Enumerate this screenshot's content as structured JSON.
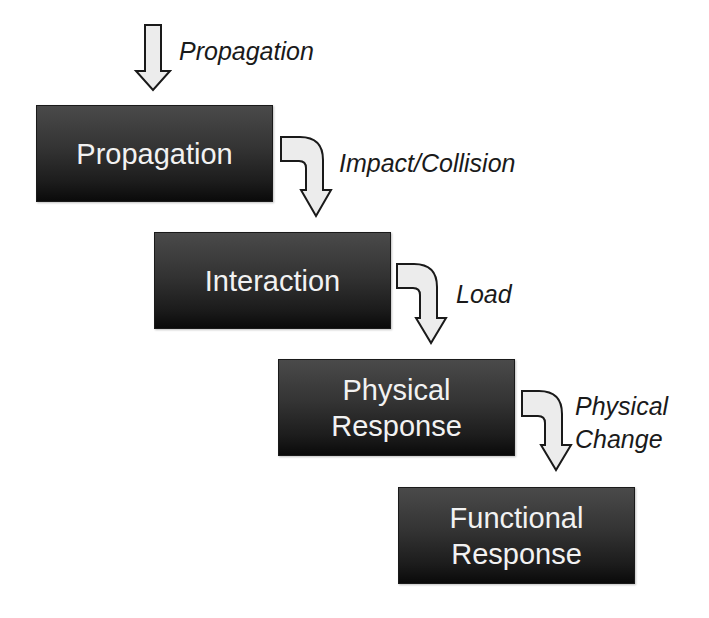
{
  "diagram": {
    "type": "flow-cascade",
    "entry_label": "Propagation",
    "stages": [
      {
        "id": "propagation",
        "lines": [
          "Propagation"
        ]
      },
      {
        "id": "interaction",
        "lines": [
          "Interaction"
        ]
      },
      {
        "id": "physical-response",
        "lines": [
          "Physical",
          "Response"
        ]
      },
      {
        "id": "functional-response",
        "lines": [
          "Functional",
          "Response"
        ]
      }
    ],
    "transitions": [
      {
        "from": "propagation",
        "to": "interaction",
        "lines": [
          "Impact/Collision"
        ]
      },
      {
        "from": "interaction",
        "to": "physical-response",
        "lines": [
          "Load"
        ]
      },
      {
        "from": "physical-response",
        "to": "functional-response",
        "lines": [
          "Physical",
          "Change"
        ]
      }
    ],
    "colors": {
      "box_top": "#4a4a4a",
      "box_bottom": "#0a0a0a",
      "box_text": "#f2f2f2",
      "arrow_fill": "#ececec",
      "arrow_stroke": "#1a1a1a",
      "label_text": "#1a1a1a"
    }
  }
}
